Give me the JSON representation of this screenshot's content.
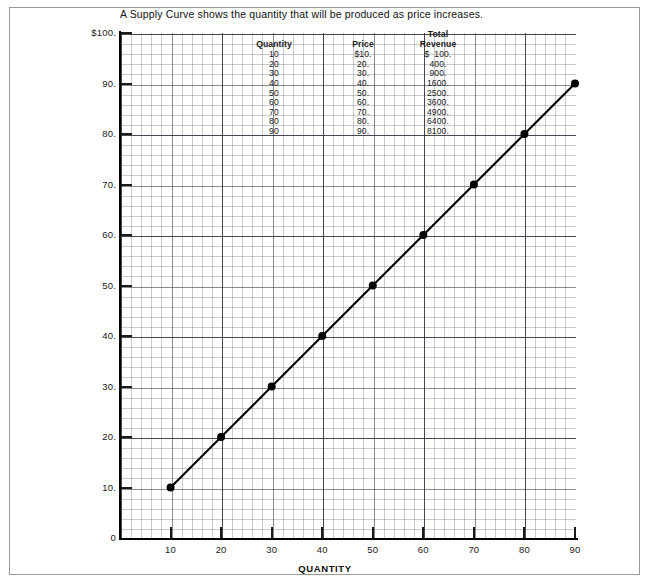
{
  "title": "A Supply Curve shows the quantity that will be produced as price increases.",
  "axis": {
    "x_title": "QUANTITY",
    "x_ticks": [
      "10",
      "20",
      "30",
      "40",
      "50",
      "60",
      "70",
      "80",
      "90"
    ],
    "y_ticks": [
      "$100.",
      "90.",
      "80.",
      "70.",
      "60.",
      "50.",
      "40.",
      "30.",
      "20.",
      "10.",
      "0"
    ]
  },
  "table": {
    "headers": {
      "quantity": "Quantity",
      "price": "Price",
      "total_revenue_line1": "Total",
      "total_revenue_line2": "Revenue"
    },
    "rows": [
      {
        "quantity": "10",
        "price": "$10.",
        "revenue": "$  100."
      },
      {
        "quantity": "20",
        "price": "20.",
        "revenue": "400."
      },
      {
        "quantity": "30",
        "price": "30.",
        "revenue": "900."
      },
      {
        "quantity": "40",
        "price": "40.",
        "revenue": "1600."
      },
      {
        "quantity": "50",
        "price": "50.",
        "revenue": "2500."
      },
      {
        "quantity": "60",
        "price": "60.",
        "revenue": "3600."
      },
      {
        "quantity": "70",
        "price": "70.",
        "revenue": "4900."
      },
      {
        "quantity": "80",
        "price": "80.",
        "revenue": "6400."
      },
      {
        "quantity": "90",
        "price": "90.",
        "revenue": "8100."
      }
    ]
  },
  "colors": {
    "line": "#000000",
    "marker": "#000000",
    "axis": "#000000",
    "grid_minor": "#50505f",
    "grid_major": "#1e1e2d",
    "frame": "#9a9a9a"
  },
  "chart_data": {
    "type": "line",
    "title": "A Supply Curve shows the quantity that will be produced as price increases.",
    "xlabel": "QUANTITY",
    "ylabel": "",
    "xlim": [
      0,
      90
    ],
    "ylim": [
      0,
      100
    ],
    "grid": true,
    "legend": "none",
    "x": [
      10,
      20,
      30,
      40,
      50,
      60,
      70,
      80,
      90
    ],
    "series": [
      {
        "name": "Supply Curve",
        "values": [
          10,
          20,
          30,
          40,
          50,
          60,
          70,
          80,
          90
        ],
        "marker": "filled-circle",
        "color": "#000000"
      }
    ],
    "table_series": [
      {
        "name": "Quantity",
        "values": [
          10,
          20,
          30,
          40,
          50,
          60,
          70,
          80,
          90
        ]
      },
      {
        "name": "Price",
        "values": [
          10,
          20,
          30,
          40,
          50,
          60,
          70,
          80,
          90
        ]
      },
      {
        "name": "Total Revenue",
        "values": [
          100,
          400,
          900,
          1600,
          2500,
          3600,
          4900,
          6400,
          8100
        ]
      }
    ]
  }
}
